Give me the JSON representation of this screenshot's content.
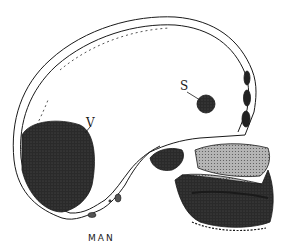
{
  "figure": {
    "caption": "MAN",
    "labels": [
      {
        "id": "V",
        "text": "V",
        "target": "large dark oval region at back of cranium"
      },
      {
        "id": "S",
        "text": "S",
        "target": "small dark circle in upper-front cranium"
      }
    ],
    "colors": {
      "ink": "#1a1a1a",
      "bone_fill": "#ffffff",
      "stipple_dark": "#2a2a2a",
      "stipple_mid": "#9a9a9a",
      "background": "#ffffff"
    }
  }
}
